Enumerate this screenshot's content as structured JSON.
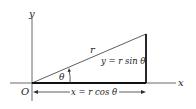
{
  "diagram": {
    "axis_labels": {
      "x": "x",
      "y": "y",
      "origin": "O"
    },
    "hypotenuse_label": "r",
    "angle_label": "θ",
    "vertical_side_label": "y = r sin θ",
    "horizontal_side_label": "x = r cos θ",
    "colors": {
      "stroke": "#222222",
      "background": "#ffffff"
    }
  }
}
